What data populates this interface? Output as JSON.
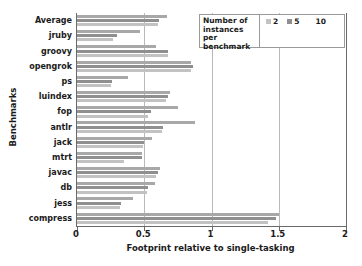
{
  "chart_data": {
    "type": "bar",
    "orientation": "horizontal",
    "title": "",
    "xlabel": "Footprint relative to single-tasking",
    "ylabel": "Benchmarks",
    "xlim": [
      0,
      2
    ],
    "ylim": null,
    "grid": true,
    "xticks": [
      "0",
      "0.5",
      "1",
      "1.5",
      "2"
    ],
    "xtick_values": [
      0,
      0.5,
      1,
      1.5,
      2
    ],
    "legend_position": "top-right",
    "legend_title": "Number of instances per benchmark",
    "legend_entries": [
      "2",
      "5",
      "10"
    ],
    "categories": [
      "Average",
      "jruby",
      "groovy",
      "opengrok",
      "ps",
      "luindex",
      "fop",
      "antlr",
      "jack",
      "mtrt",
      "javac",
      "db",
      "jess",
      "compress"
    ],
    "series": [
      {
        "name": "2",
        "color": "#c2c2c2",
        "values": [
          0.6,
          0.27,
          0.68,
          0.85,
          0.25,
          0.66,
          0.53,
          0.63,
          0.49,
          0.35,
          0.59,
          0.52,
          0.32,
          1.42
        ]
      },
      {
        "name": "5",
        "color": "#8f8f8f",
        "values": [
          0.61,
          0.3,
          0.68,
          0.86,
          0.26,
          0.68,
          0.55,
          0.64,
          0.5,
          0.48,
          0.6,
          0.53,
          0.33,
          1.48
        ]
      },
      {
        "name": "10",
        "color": "#a8a8a8",
        "values": [
          0.67,
          0.47,
          0.59,
          0.85,
          0.38,
          0.69,
          0.75,
          0.88,
          0.56,
          0.48,
          0.62,
          0.58,
          0.42,
          1.5
        ]
      }
    ]
  },
  "legend": {
    "title": "Number of instances per benchmark",
    "title_lines": [
      "Number of",
      "instances",
      "per benchmark"
    ],
    "items": [
      {
        "label": "2",
        "color": "#c2c2c2"
      },
      {
        "label": "5",
        "color": "#8f8f8f"
      },
      {
        "label": "10",
        "color": "#ffffff"
      }
    ]
  },
  "axes": {
    "x_title": "Footprint relative to single-tasking",
    "y_title": "Benchmarks"
  }
}
